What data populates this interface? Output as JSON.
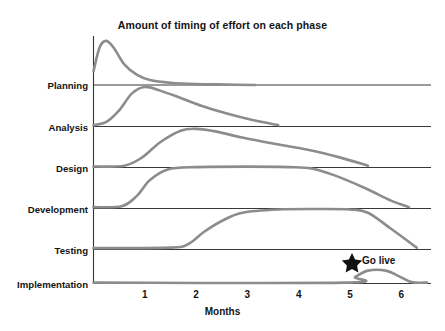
{
  "chart_data": {
    "type": "area",
    "title": "Amount of timing of effort on each phase",
    "xlabel": "Months",
    "ylabel": "",
    "grid": false,
    "legend_position": "none",
    "xlim": [
      0,
      6.65
    ],
    "xticks": [
      1,
      2,
      3,
      4,
      5,
      6
    ],
    "xtick_labels": [
      "1",
      "2",
      "3",
      "4",
      "5",
      "6"
    ],
    "categories": [
      "Planning",
      "Analysis",
      "Design",
      "Development",
      "Testing",
      "Implementation"
    ],
    "series": [
      {
        "name": "Planning",
        "description": "Sharp early peak then rapid decay to zero",
        "x": [
          0,
          0.12,
          0.25,
          0.4,
          0.6,
          0.85,
          1.1,
          1.5,
          2.0,
          2.6,
          3.15
        ],
        "values": [
          0.3,
          0.82,
          0.96,
          0.8,
          0.45,
          0.22,
          0.11,
          0.05,
          0.02,
          0.01,
          0.0
        ]
      },
      {
        "name": "Analysis",
        "description": "Rises through month 0-1, peaks near month 1, slow decline to month 3.6",
        "x": [
          0,
          0.25,
          0.5,
          0.75,
          1.0,
          1.3,
          1.7,
          2.1,
          2.6,
          3.1,
          3.6
        ],
        "values": [
          0.03,
          0.1,
          0.35,
          0.72,
          0.86,
          0.78,
          0.62,
          0.45,
          0.28,
          0.14,
          0.03
        ]
      },
      {
        "name": "Design",
        "description": "Starts near month 0.6, peaks near month 2, long slow decline to month 5.3",
        "x": [
          0,
          0.6,
          0.95,
          1.3,
          1.7,
          2.0,
          2.4,
          2.9,
          3.5,
          4.2,
          4.8,
          5.35
        ],
        "values": [
          0.02,
          0.04,
          0.22,
          0.55,
          0.8,
          0.84,
          0.78,
          0.65,
          0.52,
          0.38,
          0.22,
          0.04
        ]
      },
      {
        "name": "Development",
        "description": "Ramps up from month 0.6, plateau from month 1.4 to 4.2, decline to month 6.15",
        "x": [
          0,
          0.55,
          0.85,
          1.1,
          1.45,
          2.0,
          3.0,
          3.8,
          4.25,
          4.7,
          5.3,
          5.8,
          6.15
        ],
        "values": [
          0.03,
          0.05,
          0.28,
          0.62,
          0.85,
          0.9,
          0.91,
          0.9,
          0.87,
          0.72,
          0.44,
          0.17,
          0.03
        ]
      },
      {
        "name": "Testing",
        "description": "Flat until month 1.8, ramps to plateau from month 2.7 to 5.3, falls to month 6.3",
        "x": [
          0,
          1.5,
          1.85,
          2.15,
          2.5,
          2.9,
          3.6,
          4.4,
          5.0,
          5.35,
          5.8,
          6.3
        ],
        "values": [
          0.03,
          0.04,
          0.12,
          0.38,
          0.62,
          0.8,
          0.87,
          0.88,
          0.87,
          0.8,
          0.45,
          0.04
        ]
      },
      {
        "name": "Implementation",
        "description": "Small bump between month 5 and 6.2",
        "x": [
          0,
          4.9,
          5.1,
          5.35,
          5.7,
          5.95,
          6.2,
          6.5
        ],
        "values": [
          0.02,
          0.02,
          0.14,
          0.28,
          0.28,
          0.16,
          0.03,
          0.02
        ]
      }
    ],
    "annotations": [
      {
        "label": "Go live",
        "icon": "star-icon",
        "x": 5.1,
        "row": "Implementation"
      }
    ]
  },
  "axis": {
    "x_title": "Months",
    "tick_labels": [
      "1",
      "2",
      "3",
      "4",
      "5",
      "6"
    ],
    "row_labels": [
      "Planning",
      "Analysis",
      "Design",
      "Development",
      "Testing",
      "Implementation"
    ]
  },
  "annotation": {
    "go_live_label": "Go live"
  },
  "colors": {
    "curve": "#8c8c8c",
    "axis": "#222222",
    "text": "#141414",
    "star": "#111111",
    "background": "#ffffff"
  }
}
